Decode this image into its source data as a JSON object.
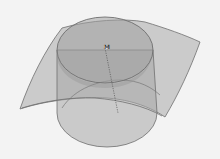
{
  "figure": {
    "point_label": "M",
    "colors": {
      "background": "#f3f3f3",
      "surface_fill": "#b9b9b9",
      "cylinder_fill": "#a9a9a9",
      "edge": "#6e6e6e",
      "axis": "#555555"
    }
  }
}
